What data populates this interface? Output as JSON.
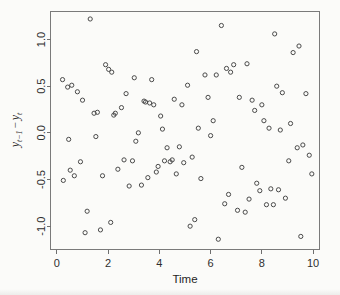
{
  "chart_data": {
    "type": "scatter",
    "title": "",
    "xlabel": "Time",
    "ylabel": "y_{t-1} - y_t",
    "ylabel_parts": {
      "var1": "y",
      "sub1": "t−1",
      "operator": "−",
      "var2": "y",
      "sub2": "t"
    },
    "xlim": [
      -0.25,
      10.25
    ],
    "ylim": [
      -1.25,
      1.3
    ],
    "xticks": [
      0,
      2,
      4,
      6,
      8,
      10
    ],
    "xtick_labels": [
      "0",
      "2",
      "4",
      "6",
      "8",
      "10"
    ],
    "yticks": [
      -1.0,
      -0.5,
      0.0,
      0.5,
      1.0
    ],
    "ytick_labels": [
      "-1.0",
      "-0.5",
      "0.0",
      "0.5",
      "1.0"
    ],
    "grid": false,
    "legend": "none",
    "marker": "open-circle",
    "marker_size": 3,
    "point_color": "#4a4a4a",
    "axis_color": "#6f6f6f",
    "background_color": "#fdfdfc",
    "n_points": 120,
    "points": [
      [
        0.22,
        0.57
      ],
      [
        0.25,
        -0.51
      ],
      [
        0.42,
        0.49
      ],
      [
        0.46,
        -0.07
      ],
      [
        0.52,
        -0.4
      ],
      [
        0.58,
        0.51
      ],
      [
        0.68,
        -0.46
      ],
      [
        0.8,
        0.44
      ],
      [
        0.92,
        -0.31
      ],
      [
        1.0,
        0.35
      ],
      [
        1.1,
        -1.07
      ],
      [
        1.18,
        -0.84
      ],
      [
        1.3,
        1.22
      ],
      [
        1.45,
        0.21
      ],
      [
        1.52,
        -0.04
      ],
      [
        1.58,
        0.22
      ],
      [
        1.7,
        -1.04
      ],
      [
        1.78,
        -0.46
      ],
      [
        1.9,
        0.73
      ],
      [
        2.02,
        0.68
      ],
      [
        2.1,
        -0.96
      ],
      [
        2.14,
        0.65
      ],
      [
        2.22,
        0.19
      ],
      [
        2.28,
        0.21
      ],
      [
        2.38,
        -0.39
      ],
      [
        2.52,
        0.27
      ],
      [
        2.62,
        -0.29
      ],
      [
        2.7,
        0.42
      ],
      [
        2.82,
        -0.57
      ],
      [
        2.95,
        -0.3
      ],
      [
        3.02,
        0.59
      ],
      [
        3.08,
        -0.09
      ],
      [
        3.18,
        0.0
      ],
      [
        3.3,
        -0.56
      ],
      [
        3.4,
        0.34
      ],
      [
        3.46,
        0.33
      ],
      [
        3.55,
        -0.48
      ],
      [
        3.62,
        0.32
      ],
      [
        3.7,
        0.57
      ],
      [
        3.78,
        0.3
      ],
      [
        3.88,
        -0.42
      ],
      [
        3.95,
        -0.36
      ],
      [
        4.05,
        0.18
      ],
      [
        4.12,
        0.04
      ],
      [
        4.2,
        -0.3
      ],
      [
        4.3,
        -0.16
      ],
      [
        4.42,
        -0.31
      ],
      [
        4.5,
        -0.29
      ],
      [
        4.58,
        0.36
      ],
      [
        4.66,
        -0.44
      ],
      [
        4.78,
        -0.15
      ],
      [
        4.88,
        0.3
      ],
      [
        4.95,
        -0.32
      ],
      [
        5.1,
        0.51
      ],
      [
        5.2,
        -1.0
      ],
      [
        5.28,
        -0.26
      ],
      [
        5.38,
        -0.93
      ],
      [
        5.45,
        0.87
      ],
      [
        5.52,
        0.05
      ],
      [
        5.62,
        -0.49
      ],
      [
        5.78,
        0.62
      ],
      [
        5.9,
        0.38
      ],
      [
        6.0,
        -0.03
      ],
      [
        6.1,
        0.13
      ],
      [
        6.22,
        0.62
      ],
      [
        6.3,
        -1.14
      ],
      [
        6.42,
        1.15
      ],
      [
        6.55,
        -0.76
      ],
      [
        6.62,
        0.69
      ],
      [
        6.7,
        -0.66
      ],
      [
        6.78,
        0.65
      ],
      [
        6.9,
        0.73
      ],
      [
        7.05,
        -0.83
      ],
      [
        7.12,
        0.38
      ],
      [
        7.22,
        -0.37
      ],
      [
        7.35,
        -0.85
      ],
      [
        7.42,
        0.74
      ],
      [
        7.5,
        -0.71
      ],
      [
        7.62,
        0.35
      ],
      [
        7.72,
        0.24
      ],
      [
        7.8,
        -0.54
      ],
      [
        7.92,
        -0.62
      ],
      [
        8.0,
        0.3
      ],
      [
        8.08,
        0.13
      ],
      [
        8.18,
        -0.77
      ],
      [
        8.28,
        0.05
      ],
      [
        8.35,
        -0.6
      ],
      [
        8.45,
        -0.77
      ],
      [
        8.5,
        1.06
      ],
      [
        8.58,
        0.5
      ],
      [
        8.65,
        -0.61
      ],
      [
        8.72,
        0.03
      ],
      [
        8.8,
        0.43
      ],
      [
        8.92,
        -0.7
      ],
      [
        9.05,
        -0.3
      ],
      [
        9.12,
        0.1
      ],
      [
        9.22,
        0.86
      ],
      [
        9.38,
        -0.16
      ],
      [
        9.45,
        0.93
      ],
      [
        9.52,
        -1.11
      ],
      [
        9.6,
        -0.13
      ],
      [
        9.72,
        0.42
      ],
      [
        9.85,
        -0.24
      ],
      [
        9.95,
        -0.44
      ]
    ]
  }
}
